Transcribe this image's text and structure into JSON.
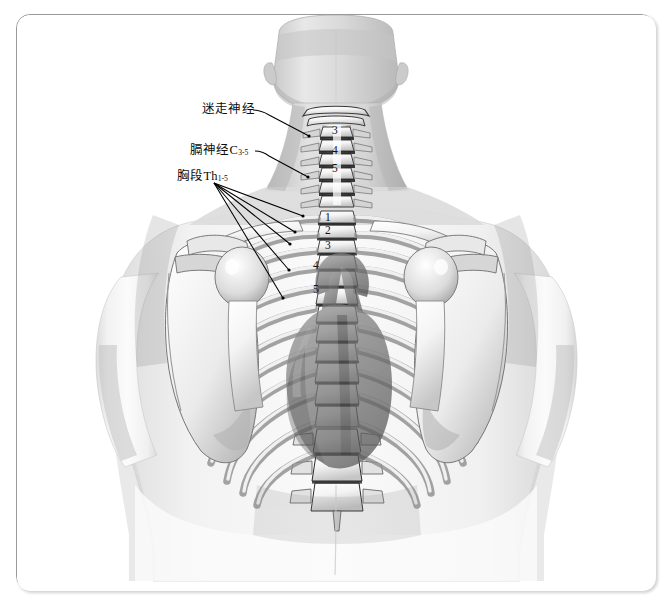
{
  "figure": {
    "view": "posterior",
    "style": "grayscale medical illustration",
    "background_color": "#ffffff",
    "frame_color": "#9a9a9a",
    "ink_color": "#0b0b0b"
  },
  "labels": [
    {
      "id": "vagus-nerve",
      "text": "迷走神经",
      "x": 201,
      "y": 104,
      "leader_from": [
        252,
        110
      ],
      "leader_to": [
        307,
        136
      ]
    },
    {
      "id": "phrenic-nerve",
      "text": "膈神经C",
      "subscript": "3-5",
      "x": 189,
      "y": 146,
      "leader_from": [
        252,
        151
      ],
      "leader_to": [
        306,
        177
      ]
    },
    {
      "id": "thoracic-segments",
      "text": "胸段Th",
      "subscript": "1-5",
      "x": 176,
      "y": 172,
      "leader_from": [
        212,
        182
      ],
      "leader_to": [
        300,
        215
      ]
    }
  ],
  "thoracic_leaders": [
    {
      "from": [
        212,
        183
      ],
      "to": [
        300,
        216
      ]
    },
    {
      "from": [
        212,
        183
      ],
      "to": [
        292,
        232
      ]
    },
    {
      "from": [
        212,
        183
      ],
      "to": [
        288,
        244
      ]
    },
    {
      "from": [
        212,
        183
      ],
      "to": [
        287,
        270
      ]
    },
    {
      "from": [
        212,
        183
      ],
      "to": [
        281,
        298
      ]
    }
  ],
  "vertebra_numbers": {
    "cervical": [
      {
        "label": "3",
        "x": 331,
        "y": 124
      },
      {
        "label": "4",
        "x": 331,
        "y": 144
      },
      {
        "label": "5",
        "x": 331,
        "y": 162
      }
    ],
    "thoracic": [
      {
        "label": "1",
        "x": 324,
        "y": 211
      },
      {
        "label": "2",
        "x": 324,
        "y": 224
      },
      {
        "label": "3",
        "x": 324,
        "y": 239
      },
      {
        "label": "4",
        "x": 312,
        "y": 259
      },
      {
        "label": "5",
        "x": 312,
        "y": 283
      }
    ]
  },
  "anatomy_regions": [
    "head-occiput",
    "neck",
    "cervical-spine",
    "clavicle-left",
    "clavicle-right",
    "scapula-left",
    "scapula-right",
    "humerus-head-left",
    "humerus-head-right",
    "rib-cage",
    "thoracic-spine",
    "lumbar-spine",
    "heart-and-great-vessels",
    "torso-outline"
  ]
}
